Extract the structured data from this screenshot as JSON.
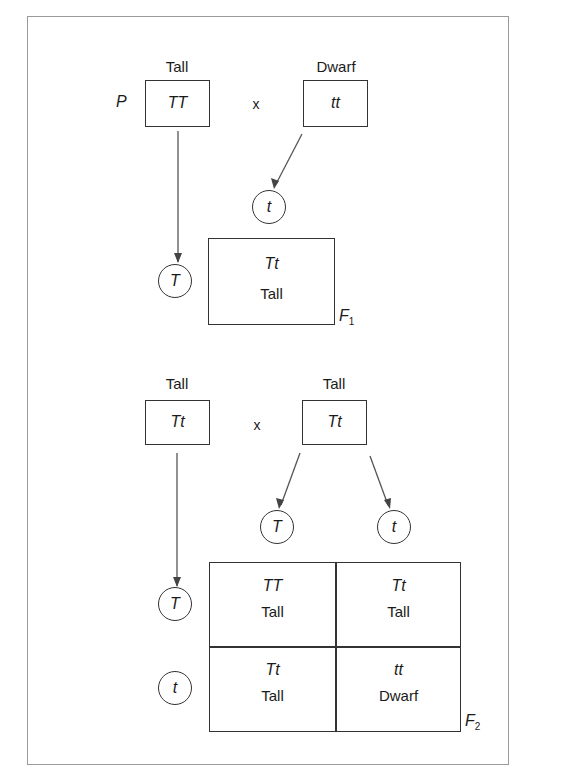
{
  "diagram": {
    "title": "",
    "parental_cross": {
      "generation_label": "P",
      "cross_symbol": "x",
      "parent1": {
        "phenotype": "Tall",
        "genotype": "TT",
        "gamete": "T"
      },
      "parent2": {
        "phenotype": "Dwarf",
        "genotype": "tt",
        "gamete": "t"
      }
    },
    "f1": {
      "generation_label": "F",
      "generation_sub": "1",
      "offspring": {
        "genotype": "Tt",
        "phenotype": "Tall"
      }
    },
    "f1_cross": {
      "cross_symbol": "x",
      "parent1": {
        "phenotype": "Tall",
        "genotype": "Tt",
        "gametes": [
          "T",
          "t"
        ]
      },
      "parent2": {
        "phenotype": "Tall",
        "genotype": "Tt",
        "gametes": [
          "T",
          "t"
        ]
      }
    },
    "f2": {
      "generation_label": "F",
      "generation_sub": "2",
      "punnett": [
        [
          {
            "genotype": "TT",
            "phenotype": "Tall"
          },
          {
            "genotype": "Tt",
            "phenotype": "Tall"
          }
        ],
        [
          {
            "genotype": "Tt",
            "phenotype": "Tall"
          },
          {
            "genotype": "tt",
            "phenotype": "Dwarf"
          }
        ]
      ]
    }
  }
}
